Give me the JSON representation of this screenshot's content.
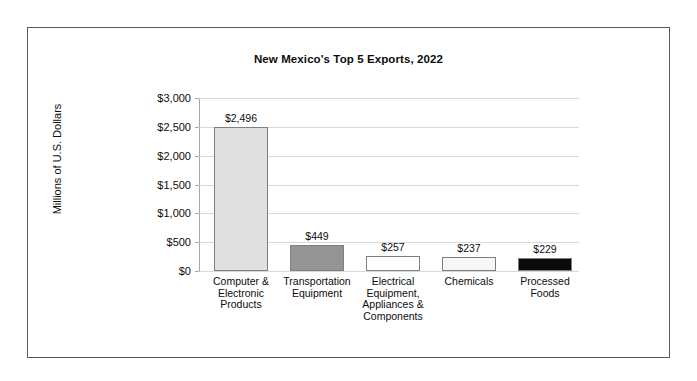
{
  "chart_data": {
    "type": "bar",
    "title": "New Mexico's Top 5 Exports, 2022",
    "xlabel": "",
    "ylabel": "Millions of U.S. Dollars",
    "ylim": [
      0,
      3000
    ],
    "ytick_labels": [
      "$3,000",
      "$2,500",
      "$2,000",
      "$1,500",
      "$1,000",
      "$500",
      "$0"
    ],
    "ytick_values": [
      3000,
      2500,
      2000,
      1500,
      1000,
      500,
      0
    ],
    "grid": true,
    "legend": "none",
    "categories": [
      "Computer & Electronic Products",
      "Transportation Equipment",
      "Electrical Equipment, Appliances & Components",
      "Chemicals",
      "Processed Foods"
    ],
    "category_lines": [
      [
        "Computer &",
        "Electronic",
        "Products"
      ],
      [
        "Transportation",
        "Equipment"
      ],
      [
        "Electrical",
        "Equipment,",
        "Appliances &",
        "Components"
      ],
      [
        "Chemicals"
      ],
      [
        "Processed",
        "Foods"
      ]
    ],
    "values": [
      2496,
      449,
      257,
      237,
      229
    ],
    "value_labels": [
      "$2,496",
      "$449",
      "$257",
      "$237",
      "$229"
    ],
    "bar_colors": [
      "#e0e0e0",
      "#949494",
      "#ffffff",
      "#f7f7f7",
      "#0a0a0a"
    ],
    "bar_border_color": "#7f7f7f"
  }
}
